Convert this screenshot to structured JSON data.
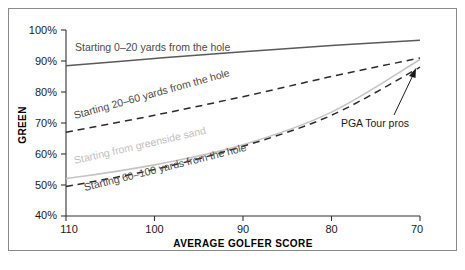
{
  "chart_data": {
    "type": "line",
    "title": "",
    "xlabel": "AVERAGE GOLFER SCORE",
    "ylabel": "GREEN",
    "x": [
      110,
      100,
      90,
      80,
      70
    ],
    "xlim": [
      110,
      70
    ],
    "x_reversed": true,
    "ylim": [
      40,
      100
    ],
    "yticks": [
      40,
      50,
      60,
      70,
      80,
      90,
      100
    ],
    "ytick_labels": [
      "40%",
      "50%",
      "60%",
      "70%",
      "80%",
      "90%",
      "100%"
    ],
    "xtick_labels": [
      "110",
      "100",
      "90",
      "80",
      "70"
    ],
    "grid": false,
    "legend_position": "inline-labels",
    "series": [
      {
        "name": "Starting 0–20 yards from the hole",
        "style": "solid",
        "color": "#5a5a5a",
        "values": [
          88.5,
          90.8,
          93.0,
          95.0,
          96.7
        ]
      },
      {
        "name": "Starting 20–60 yards from the hole",
        "style": "dashed",
        "color": "#2b2b2b",
        "values": [
          67.0,
          72.5,
          78.5,
          85.0,
          91.0
        ]
      },
      {
        "name": "Starting from greenside sand",
        "style": "solid",
        "color": "#c4c4c4",
        "values": [
          52.0,
          56.5,
          63.0,
          73.5,
          90.5
        ]
      },
      {
        "name": "Starting 60–100 yards from the hole",
        "style": "dashed",
        "color": "#2b2b2b",
        "values": [
          49.5,
          55.0,
          62.5,
          72.5,
          88.0
        ]
      }
    ],
    "annotations": [
      {
        "text": "PGA Tour pros",
        "points_to_x": 70,
        "points_to_y": 89
      }
    ]
  }
}
